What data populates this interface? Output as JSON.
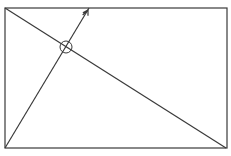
{
  "diagram": {
    "type": "geometry",
    "stroke_color": "#3a3a3a",
    "background": "#ffffff",
    "rectangle": {
      "x1": 5,
      "y1": 8,
      "x2": 227,
      "y2": 148
    },
    "lines": [
      {
        "name": "diagonal",
        "x1": 5,
        "y1": 8,
        "x2": 226,
        "y2": 148
      },
      {
        "name": "slant-line",
        "x1": 5,
        "y1": 148,
        "x2": 89,
        "y2": 8
      }
    ],
    "intersection_circle": {
      "cx": 66,
      "cy": 47,
      "r": 6
    },
    "arrow_mark": {
      "x": 88,
      "y": 10
    }
  }
}
